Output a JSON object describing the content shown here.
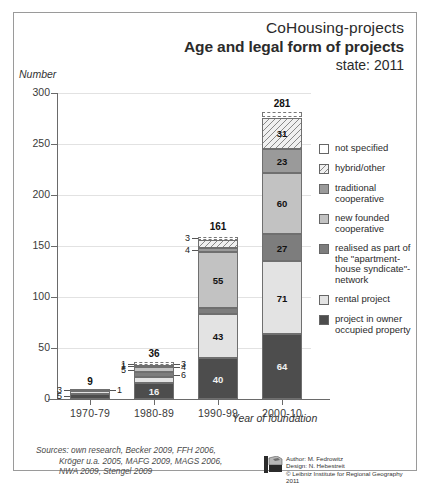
{
  "header": {
    "line1": "CoHousing-projects",
    "line2": "Age and legal form of projects",
    "line3": "state: 2011"
  },
  "axis": {
    "y_label": "Number",
    "x_label": "Year of foundation",
    "y_ticks": [
      "0",
      "50",
      "100",
      "150",
      "200",
      "250",
      "300"
    ]
  },
  "footer": {
    "sources": "Sources: own research, Becker 2009, FFH 2006,\n          Kröger u.a. 2005, MAFG 2009, MAGS 2006,\n          NWA 2009, Stengel 2009",
    "author": "Author: M. Fedrowitz",
    "design": "Design: N. Hebestreit",
    "copyright": "© Leibniz Institute for Regional Geography 2011"
  },
  "legend": {
    "items": [
      {
        "label": "not specified",
        "key": "not_specified"
      },
      {
        "label": "hybrid/other",
        "key": "hybrid_other"
      },
      {
        "label": "traditional cooperative",
        "key": "traditional_coop"
      },
      {
        "label": "new founded cooperative",
        "key": "new_coop"
      },
      {
        "label": "realised as part of the \"apartment-house syndicate\"-network",
        "key": "syndicate"
      },
      {
        "label": "rental project",
        "key": "rental"
      },
      {
        "label": "project in owner occupied property",
        "key": "owner"
      }
    ]
  },
  "chart_data": {
    "type": "bar",
    "subtype": "stacked",
    "title": "Age and legal form of projects",
    "subtitle": "CoHousing-projects / state: 2011",
    "xlabel": "Year of foundation",
    "ylabel": "Number",
    "ylim": [
      0,
      300
    ],
    "ytick_step": 50,
    "grid": true,
    "legend_position": "right",
    "categories": [
      "1970-79",
      "1980-89",
      "1990-99",
      "2000-10"
    ],
    "totals": [
      9,
      36,
      161,
      281
    ],
    "series": [
      {
        "name": "project in owner occupied property",
        "values": [
          5,
          16,
          40,
          64
        ],
        "color": "#4d4d4d"
      },
      {
        "name": "rental project",
        "values": [
          3,
          6,
          43,
          71
        ],
        "color": "#e3e3e3"
      },
      {
        "name": "realised as part of the \"apartment-house syndicate\"-network",
        "values": [
          0,
          4,
          6,
          27
        ],
        "color": "#7d7d7d"
      },
      {
        "name": "new founded cooperative",
        "values": [
          0,
          5,
          55,
          60
        ],
        "color": "#c2c2c2"
      },
      {
        "name": "traditional cooperative",
        "values": [
          1,
          1,
          4,
          23
        ],
        "color": "#9a9a9a"
      },
      {
        "name": "hybrid/other",
        "values": [
          0,
          1,
          8,
          31
        ],
        "color": "#f0f0f0"
      },
      {
        "name": "not specified",
        "values": [
          0,
          3,
          3,
          5
        ],
        "color": "#ffffff"
      }
    ]
  }
}
